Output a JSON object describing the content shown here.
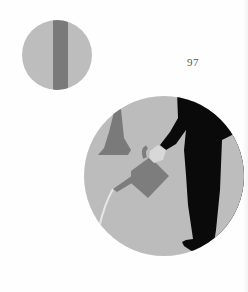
{
  "page": {
    "number": "97"
  },
  "illustrations": [
    {
      "name": "small-circle-tree-trunk",
      "shape": "circle",
      "center": [
        57,
        55
      ],
      "radius": 35,
      "background_color": "#bdbdbd",
      "stripe_color": "#7a7a7a"
    },
    {
      "name": "large-circle-watering-scene",
      "shape": "circle",
      "center": [
        164,
        176
      ],
      "radius": 80,
      "background_color": "#bcbcbc",
      "figure_color": "#0a0a0a",
      "watering_can_color": "#7d7d7d",
      "bell_color": "#7a7a7a",
      "cuff_color": "#d8d8d8",
      "water_stream_color": "#e6e6e6"
    }
  ]
}
